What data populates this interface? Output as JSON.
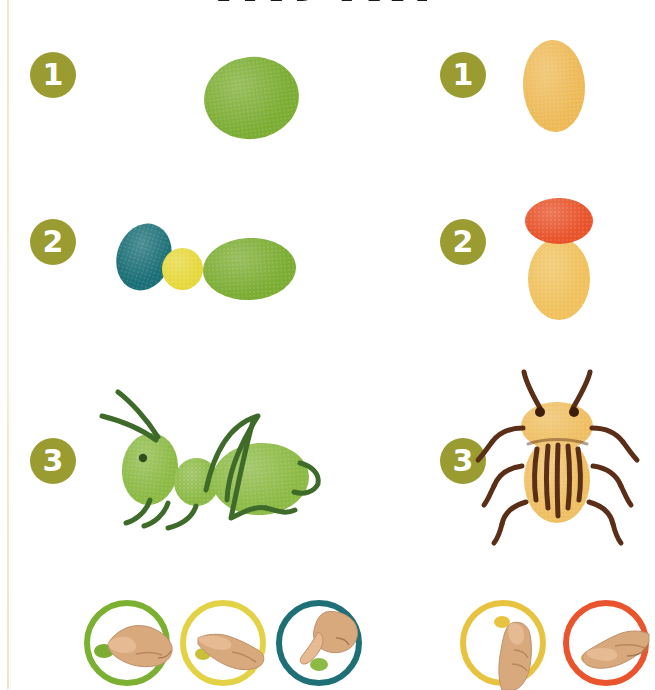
{
  "page": {
    "title": "ЖУКИ",
    "background_color": "#ffffff",
    "trim_line_color": "#e9e6bd"
  },
  "badge_style": {
    "fill": "#9a9b31",
    "text_color": "#ffffff"
  },
  "projects": [
    {
      "name": "grasshopper",
      "steps": [
        {
          "number": "1",
          "badge_name": "step-badge-1-left",
          "description": "one green thumbprint body",
          "prints": [
            {
              "color": "#7cad33",
              "name": "green-thumbprint-body"
            }
          ]
        },
        {
          "number": "2",
          "badge_name": "step-badge-2-left",
          "description": "teal head, yellow thorax, green abdomen",
          "prints": [
            {
              "color": "#1b6f76",
              "name": "teal-thumbprint-head"
            },
            {
              "color": "#e6d83c",
              "name": "yellow-fingerprint-thorax"
            },
            {
              "color": "#7cad33",
              "name": "green-thumbprint-abdomen"
            }
          ]
        },
        {
          "number": "3",
          "badge_name": "step-badge-3-left",
          "description": "finished grasshopper with drawn legs and antennae",
          "line_color": "#3f6b2a",
          "eye_color": "#2e4f1f",
          "prints": [
            {
              "color": "#8cba45",
              "name": "green-thumbprint-head"
            },
            {
              "color": "#8cba45",
              "name": "green-fingerprint-thorax"
            },
            {
              "color": "#8cba45",
              "name": "green-thumbprint-abdomen"
            }
          ]
        }
      ]
    },
    {
      "name": "potato-beetle",
      "steps": [
        {
          "number": "1",
          "badge_name": "step-badge-1-right",
          "description": "one golden thumbprint body",
          "prints": [
            {
              "color": "#eeba58",
              "name": "yellow-thumbprint-body"
            }
          ]
        },
        {
          "number": "2",
          "badge_name": "step-badge-2-right",
          "description": "orange head print over yellow body print",
          "prints": [
            {
              "color": "#e8532a",
              "name": "orange-fingerprint-head"
            },
            {
              "color": "#f0c15c",
              "name": "yellow-thumbprint-body"
            }
          ]
        },
        {
          "number": "3",
          "badge_name": "step-badge-3-right",
          "description": "finished beetle with brown legs, antennae and stripes",
          "line_color": "#5b2f17",
          "eye_color": "#3f1d0d",
          "prints": [
            {
              "color": "#efbf63",
              "name": "yellow-thumbprint-thorax"
            },
            {
              "color": "#efbf63",
              "name": "yellow-thumbprint-abdomen"
            }
          ]
        }
      ]
    }
  ],
  "color_guide": {
    "left": [
      {
        "ring_color": "#7cb030",
        "dot_color": "#7cad33",
        "gesture": "hand-pointing-right",
        "name": "guide-circle-green"
      },
      {
        "ring_color": "#e3d245",
        "dot_color": "#c9c03a",
        "gesture": "hand-pointing-right",
        "name": "guide-circle-yellow"
      },
      {
        "ring_color": "#1f7076",
        "dot_color": "#8cba45",
        "gesture": "hand-pointing-down",
        "name": "guide-circle-teal"
      }
    ],
    "right": [
      {
        "ring_color": "#e8c33f",
        "dot_color": "#e8c33f",
        "gesture": "thumb-up",
        "name": "guide-circle-yellow-right"
      },
      {
        "ring_color": "#e9542c",
        "dot_color": "#e0a93a",
        "gesture": "hand-pointing-left",
        "name": "guide-circle-orange"
      }
    ]
  }
}
